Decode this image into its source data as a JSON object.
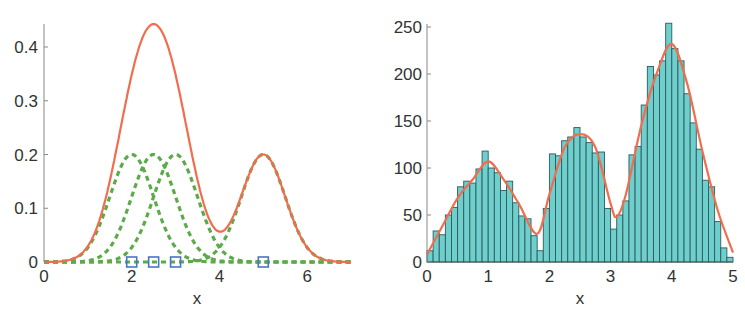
{
  "chart_data": [
    {
      "type": "line",
      "title": "",
      "xlabel": "x",
      "ylabel": "",
      "xlim": [
        0,
        7
      ],
      "ylim": [
        0,
        0.45
      ],
      "xticks": [
        0,
        2,
        4,
        6
      ],
      "xtick_labels": [
        "0",
        "2",
        "4",
        "6"
      ],
      "yticks": [
        0,
        0.1,
        0.2,
        0.3,
        0.4
      ],
      "ytick_labels": [
        "0",
        "0.1",
        "0.2",
        "0.3",
        "0.4"
      ],
      "grid": false,
      "legend": null,
      "components": {
        "description": "Gaussian kernels (dashed green), centers marked by blue squares",
        "centers": [
          2,
          2.5,
          3,
          5
        ],
        "peak_height": 0.2,
        "sigma": 0.5
      },
      "series": [
        {
          "name": "sum (kernel density)",
          "style": "solid",
          "color": "#F06E4E",
          "x": [
            0,
            0.5,
            1,
            1.5,
            2,
            2.5,
            3,
            3.5,
            4,
            4.5,
            5,
            5.5,
            6,
            6.5,
            7
          ],
          "values": [
            0.0,
            0.001,
            0.027,
            0.147,
            0.347,
            0.443,
            0.347,
            0.149,
            0.057,
            0.121,
            0.2,
            0.121,
            0.027,
            0.002,
            0.0
          ]
        },
        {
          "name": "kernel at 2",
          "style": "dashed",
          "color": "#5DAA4A"
        },
        {
          "name": "kernel at 2.5",
          "style": "dashed",
          "color": "#5DAA4A"
        },
        {
          "name": "kernel at 3",
          "style": "dashed",
          "color": "#5DAA4A"
        },
        {
          "name": "kernel at 5",
          "style": "dashed",
          "color": "#5DAA4A"
        },
        {
          "name": "data points",
          "style": "markers",
          "marker": "square",
          "color": "#4A74C8",
          "x": [
            2,
            2.5,
            3,
            5
          ],
          "values": [
            0,
            0,
            0,
            0
          ]
        }
      ]
    },
    {
      "type": "bar",
      "subtype": "histogram with fitted density curve",
      "title": "",
      "xlabel": "x",
      "ylabel": "",
      "xlim": [
        0,
        5
      ],
      "ylim": [
        0,
        255
      ],
      "xticks": [
        0,
        1,
        2,
        3,
        4,
        5
      ],
      "xtick_labels": [
        "0",
        "1",
        "2",
        "3",
        "4",
        "5"
      ],
      "yticks": [
        0,
        50,
        100,
        150,
        200,
        250
      ],
      "ytick_labels": [
        "0",
        "50",
        "100",
        "150",
        "200",
        "250"
      ],
      "grid": false,
      "legend": null,
      "bin_width": 0.1,
      "bin_edges_start": 0,
      "values": [
        12,
        33,
        29,
        50,
        58,
        80,
        86,
        84,
        99,
        118,
        100,
        95,
        76,
        86,
        63,
        49,
        46,
        28,
        12,
        57,
        115,
        113,
        129,
        133,
        143,
        133,
        127,
        116,
        117,
        57,
        35,
        50,
        65,
        114,
        123,
        167,
        208,
        199,
        214,
        254,
        227,
        214,
        179,
        148,
        120,
        87,
        80,
        43,
        15,
        5
      ],
      "bar_color": "#6ECFCC",
      "bar_edge_color": "#2E5A5E",
      "curve": {
        "name": "fitted density",
        "color": "#F06E4E",
        "x": [
          0,
          0.25,
          0.5,
          0.75,
          1.0,
          1.25,
          1.5,
          1.8,
          2.0,
          2.25,
          2.5,
          2.75,
          3.0,
          3.1,
          3.25,
          3.5,
          3.75,
          4.0,
          4.25,
          4.5,
          4.75,
          5.0
        ],
        "values": [
          8,
          38,
          68,
          88,
          107,
          88,
          62,
          30,
          72,
          122,
          136,
          122,
          62,
          48,
          72,
          145,
          200,
          232,
          190,
          118,
          55,
          10
        ]
      }
    }
  ],
  "left_chart": {
    "xlabel": "x",
    "xtick_labels": [
      "0",
      "2",
      "4",
      "6"
    ],
    "ytick_labels": [
      "0",
      "0.1",
      "0.2",
      "0.3",
      "0.4"
    ]
  },
  "right_chart": {
    "xlabel": "x",
    "xtick_labels": [
      "0",
      "1",
      "2",
      "3",
      "4",
      "5"
    ],
    "ytick_labels": [
      "0",
      "50",
      "100",
      "150",
      "200",
      "250"
    ]
  },
  "colors": {
    "curve": "#F06E4E",
    "kernel": "#5DAA4A",
    "marker": "#4A74C8",
    "bar": "#6ECFCC",
    "bar_edge": "#2E5A5E",
    "axis": "#888888"
  }
}
